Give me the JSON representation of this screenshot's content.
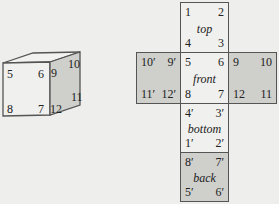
{
  "cube": {
    "front_labels": [
      "5",
      "6",
      "7",
      "8"
    ],
    "side_labels": [
      "9",
      "10",
      "11",
      "12"
    ]
  },
  "net": {
    "top": {
      "name": "top",
      "tl": "1",
      "tr": "2",
      "bl": "4",
      "br": "3"
    },
    "front": {
      "name": "front",
      "tl": "5",
      "tr": "6",
      "bl": "8",
      "br": "7"
    },
    "left": {
      "name": "",
      "tl": "10′",
      "tr": "9′",
      "bl": "11′",
      "br": "12′"
    },
    "right": {
      "name": "",
      "tl": "9",
      "tr": "10",
      "bl": "12",
      "br": "11"
    },
    "bottom": {
      "name": "bottom",
      "tl": "4′",
      "tr": "3′",
      "bl": "1′",
      "br": "2′"
    },
    "back": {
      "name": "back",
      "tl": "8′",
      "tr": "7′",
      "bl": "5′",
      "br": "6′"
    }
  },
  "colors": {
    "shade": "#cfcfcc",
    "light": "#f0f0ee",
    "edge": "#555555"
  }
}
